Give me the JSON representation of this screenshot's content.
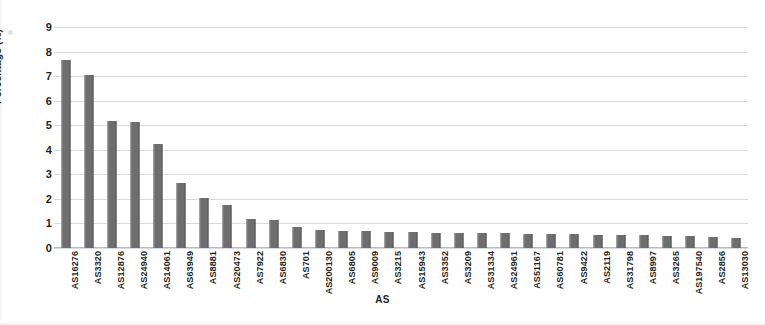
{
  "chart_data": {
    "type": "bar",
    "title": "",
    "xlabel": "AS",
    "ylabel": "Percentage (%)",
    "ylim": [
      0,
      9
    ],
    "yticks": [
      0,
      1,
      2,
      3,
      4,
      5,
      6,
      7,
      8,
      9
    ],
    "grid": true,
    "legend": "none",
    "bar_color": "#6e6e6e",
    "gridline_color": "#d7dbe0",
    "categories": [
      "AS16276",
      "AS3320",
      "AS12876",
      "AS24940",
      "AS14061",
      "AS63949",
      "AS8881",
      "AS20473",
      "AS7922",
      "AS6830",
      "AS701",
      "AS200130",
      "AS6805",
      "AS9009",
      "AS3215",
      "AS15943",
      "AS3352",
      "AS3209",
      "AS31334",
      "AS24961",
      "AS51167",
      "AS60781",
      "AS9422",
      "AS2119",
      "AS31798",
      "AS8997",
      "AS3265",
      "AS197540",
      "AS2856",
      "AS13030"
    ],
    "values": [
      7.65,
      7.05,
      5.17,
      5.15,
      4.25,
      2.65,
      2.05,
      1.75,
      1.2,
      1.15,
      0.85,
      0.72,
      0.7,
      0.68,
      0.66,
      0.64,
      0.63,
      0.62,
      0.6,
      0.6,
      0.58,
      0.57,
      0.56,
      0.55,
      0.54,
      0.52,
      0.5,
      0.48,
      0.45,
      0.42
    ]
  }
}
